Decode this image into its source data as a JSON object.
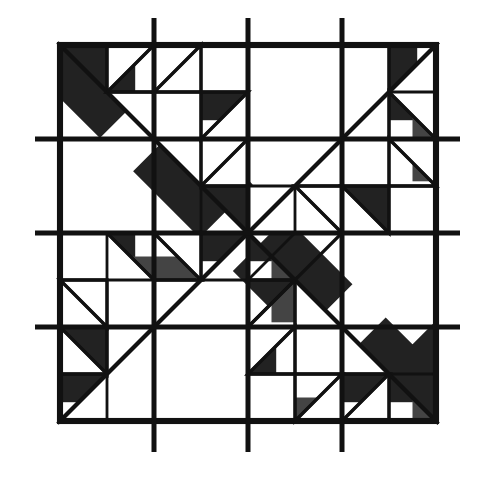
{
  "diagram": {
    "title": "",
    "type": "quilt-block-pattern",
    "grid": {
      "blocks": 4,
      "cells_per_block": 2
    },
    "colors": {
      "line": "#111111",
      "background": "#ffffff",
      "dot": "#111111",
      "hatch": "#222222"
    },
    "fills": [
      "crosshatch",
      "dotted",
      "white"
    ]
  }
}
